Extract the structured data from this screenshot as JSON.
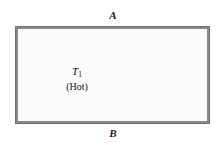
{
  "figure": {
    "edge_labels": {
      "top": "A",
      "bottom": "B"
    },
    "colors": {
      "wall": "#8a8a8a",
      "wall_outline": "#6f6f6f",
      "chamber_fill": "#fafafa",
      "speckle": "#9a9a9a",
      "text": "#111111",
      "page_background": "#ffffff"
    },
    "chambers": [
      {
        "id": "left",
        "temperature_symbol": "T",
        "temperature_subscript": "1",
        "state": "(Hot)"
      },
      {
        "id": "right",
        "temperature_symbol": "T",
        "temperature_subscript": "2",
        "state": "(Cold)"
      }
    ]
  }
}
